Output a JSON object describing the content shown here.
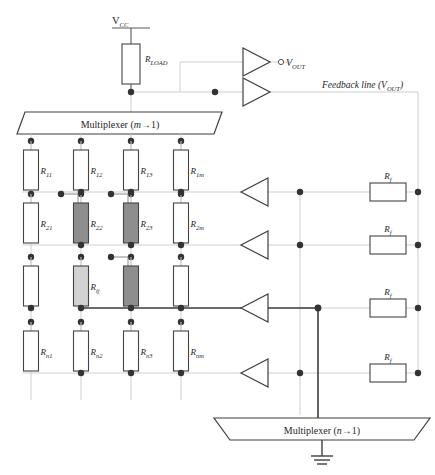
{
  "diagram": {
    "supply": {
      "label": "V",
      "sub": "CC"
    },
    "load_resistor": {
      "label": "R",
      "sub": "LOAD"
    },
    "output": {
      "marker": "open-circle",
      "label": "V",
      "sub": "OUT"
    },
    "feedback_note": {
      "prefix": "Feedback line (",
      "label": "V",
      "sub": "OUT",
      "suffix": ")"
    },
    "multiplexer_top": {
      "prefix": "Multiplexer (",
      "var": "m",
      "arrow": "→",
      "count": "1",
      "suffix": ")"
    },
    "multiplexer_bottom": {
      "prefix": "Multiplexer (",
      "var": "n",
      "arrow": "→",
      "count": "1",
      "suffix": ")"
    },
    "ground": {
      "name": "ground-symbol"
    }
  },
  "matrix": {
    "columns": 4,
    "rows": 4,
    "cells": [
      {
        "row": 0,
        "col": 0,
        "label": "R",
        "sub": "11",
        "shade": "blank",
        "tap": false
      },
      {
        "row": 0,
        "col": 1,
        "label": "R",
        "sub": "12",
        "shade": "blank",
        "tap": false
      },
      {
        "row": 0,
        "col": 2,
        "label": "R",
        "sub": "13",
        "shade": "blank",
        "tap": false
      },
      {
        "row": 0,
        "col": 3,
        "label": "R",
        "sub": "1m",
        "shade": "blank",
        "tap": false
      },
      {
        "row": 1,
        "col": 0,
        "label": "R",
        "sub": "21",
        "shade": "blank",
        "tap": false
      },
      {
        "row": 1,
        "col": 1,
        "label": "R",
        "sub": "22",
        "shade": "dark",
        "tap": true
      },
      {
        "row": 1,
        "col": 2,
        "label": "R",
        "sub": "23",
        "shade": "dark",
        "tap": true
      },
      {
        "row": 1,
        "col": 3,
        "label": "R",
        "sub": "2m",
        "shade": "blank",
        "tap": false
      },
      {
        "row": 2,
        "col": 0,
        "label": "",
        "sub": "",
        "shade": "blank",
        "tap": false
      },
      {
        "row": 2,
        "col": 1,
        "label": "R",
        "sub": "ij",
        "shade": "light",
        "tap": false
      },
      {
        "row": 2,
        "col": 2,
        "label": "",
        "sub": "",
        "shade": "dark",
        "tap": true
      },
      {
        "row": 2,
        "col": 3,
        "label": "",
        "sub": "",
        "shade": "blank",
        "tap": false
      },
      {
        "row": 3,
        "col": 0,
        "label": "R",
        "sub": "n1",
        "shade": "blank",
        "tap": false
      },
      {
        "row": 3,
        "col": 1,
        "label": "R",
        "sub": "n2",
        "shade": "blank",
        "tap": false
      },
      {
        "row": 3,
        "col": 2,
        "label": "R",
        "sub": "n3",
        "shade": "blank",
        "tap": false
      },
      {
        "row": 3,
        "col": 3,
        "label": "R",
        "sub": "nm",
        "shade": "blank",
        "tap": false
      }
    ]
  },
  "feedback_resistors": [
    {
      "index": 0,
      "label": "R",
      "sub": "f"
    },
    {
      "index": 1,
      "label": "R",
      "sub": "f"
    },
    {
      "index": 2,
      "label": "R",
      "sub": "f"
    },
    {
      "index": 3,
      "label": "R",
      "sub": "f"
    }
  ],
  "amplifiers": [
    {
      "index": 0,
      "name": "amp-output-top",
      "direction": "right"
    },
    {
      "index": 1,
      "name": "amp-feedback",
      "direction": "right"
    },
    {
      "index": 2,
      "name": "amp-row-1",
      "direction": "left"
    },
    {
      "index": 3,
      "name": "amp-row-2",
      "direction": "left"
    },
    {
      "index": 4,
      "name": "amp-row-3",
      "direction": "left"
    },
    {
      "index": 5,
      "name": "amp-row-4",
      "direction": "left"
    }
  ],
  "colors": {
    "ink": "#2a2a2a",
    "wire_faint": "#cfcfcf",
    "wire_dark": "#3a3a3a",
    "shade_dark": "#8e8e8e",
    "shade_light": "#d2d2d2",
    "node": "#333333"
  }
}
